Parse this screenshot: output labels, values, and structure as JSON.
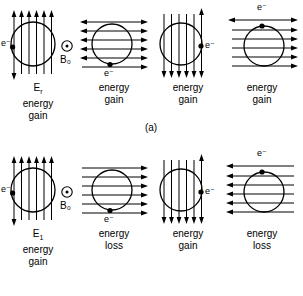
{
  "figure": {
    "caption_a": "(a)",
    "caption_b": "(b)",
    "electron_label": "e⁻",
    "field_label": "B₀",
    "energy_word": "energy",
    "gain_word": "gain",
    "loss_word": "loss",
    "line_color": "#000000",
    "background_color": "#ffffff"
  },
  "rows": [
    {
      "id": "a",
      "caption": "(a)",
      "panels": [
        {
          "index": 1,
          "field_direction": "up",
          "field_orientation": "vertical",
          "electron_position": "left",
          "electron_label": "e⁻",
          "has_b0_symbol": true,
          "b0_label": "B₀",
          "energy_symbol": "E",
          "energy_subscript": "r",
          "energy_line1": "energy",
          "energy_line2": "gain",
          "result": "energy gain"
        },
        {
          "index": 2,
          "field_direction": "right",
          "field_orientation": "horizontal",
          "electron_position": "bottom",
          "electron_label": "e⁻",
          "has_b0_symbol": false,
          "b0_label": "",
          "energy_symbol": "",
          "energy_subscript": "",
          "energy_line1": "energy",
          "energy_line2": "gain",
          "result": "energy gain"
        },
        {
          "index": 3,
          "field_direction": "down",
          "field_orientation": "vertical",
          "electron_position": "right",
          "electron_label": "e⁻",
          "has_b0_symbol": false,
          "b0_label": "",
          "energy_symbol": "",
          "energy_subscript": "",
          "energy_line1": "energy",
          "energy_line2": "gain",
          "result": "energy gain"
        },
        {
          "index": 4,
          "field_direction": "right",
          "field_orientation": "horizontal",
          "electron_position": "top",
          "electron_label": "e⁻",
          "has_b0_symbol": false,
          "b0_label": "",
          "energy_symbol": "",
          "energy_subscript": "",
          "energy_line1": "energy",
          "energy_line2": "gain",
          "result": "energy gain"
        }
      ]
    },
    {
      "id": "b",
      "caption": "(b)",
      "panels": [
        {
          "index": 1,
          "field_direction": "up",
          "field_orientation": "vertical",
          "electron_position": "left",
          "electron_label": "e⁻",
          "has_b0_symbol": true,
          "b0_label": "B₀",
          "energy_symbol": "E",
          "energy_subscript": "1",
          "energy_line1": "energy",
          "energy_line2": "gain",
          "result": "energy gain"
        },
        {
          "index": 2,
          "field_direction": "right",
          "field_orientation": "horizontal",
          "electron_position": "bottom",
          "electron_label": "e⁻",
          "has_b0_symbol": false,
          "b0_label": "",
          "energy_symbol": "",
          "energy_subscript": "",
          "energy_line1": "energy",
          "energy_line2": "loss",
          "result": "energy loss"
        },
        {
          "index": 3,
          "field_direction": "down",
          "field_orientation": "vertical",
          "electron_position": "right",
          "electron_label": "e⁻",
          "has_b0_symbol": false,
          "b0_label": "",
          "energy_symbol": "",
          "energy_subscript": "",
          "energy_line1": "energy",
          "energy_line2": "gain",
          "result": "energy gain"
        },
        {
          "index": 4,
          "field_direction": "left",
          "field_orientation": "horizontal",
          "electron_position": "top",
          "electron_label": "e⁻",
          "has_b0_symbol": false,
          "b0_label": "",
          "energy_symbol": "",
          "energy_subscript": "",
          "energy_line1": "energy",
          "energy_line2": "loss",
          "result": "energy loss"
        }
      ]
    }
  ]
}
